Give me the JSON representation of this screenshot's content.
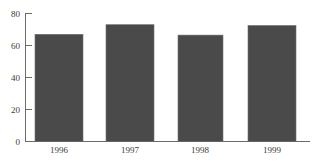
{
  "chart_data": {
    "type": "bar",
    "title": "",
    "subtitle": "",
    "xlabel": "",
    "ylabel": "",
    "categories": [
      "1996",
      "1997",
      "1998",
      "1999"
    ],
    "values": [
      30,
      42,
      67,
      73
    ],
    "series": [
      {
        "name": "",
        "values": [
          30,
          42,
          67,
          73
        ]
      }
    ],
    "ylim": [
      0,
      80
    ],
    "yticks": [
      0,
      20,
      40,
      60,
      80
    ],
    "ytick_labels": [
      "0",
      "20",
      "40",
      "60",
      "80"
    ],
    "xtick_labels": [
      "1996",
      "1997",
      "1998",
      "1999"
    ],
    "grid": false,
    "legend": false,
    "legend_position": "none",
    "bar_color": "#4a4a4a",
    "axis_color": "#6b6b6b",
    "background_color": "#ffffff",
    "annotations": []
  }
}
